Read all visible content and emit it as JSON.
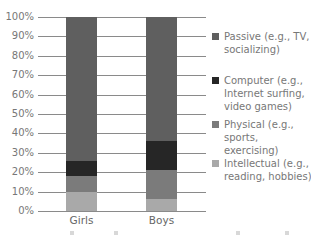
{
  "chart_data": {
    "type": "bar",
    "stacked": true,
    "orientation": "vertical",
    "title": "",
    "xlabel": "",
    "ylabel": "",
    "ylim": [
      0,
      100
    ],
    "y_ticks": [
      "0%",
      "10%",
      "20%",
      "30%",
      "40%",
      "50%",
      "60%",
      "70%",
      "80%",
      "90%",
      "100%"
    ],
    "grid": true,
    "legend_position": "right",
    "categories": [
      "Girls",
      "Boys"
    ],
    "series": [
      {
        "name": "Intellectual (e.g., reading, hobbies)",
        "color": "#a9a9a9",
        "values": [
          10,
          6
        ]
      },
      {
        "name": "Physical (e.g., sports, exercising)",
        "color": "#7b7b7b",
        "values": [
          8,
          15
        ]
      },
      {
        "name": "Computer (e.g., Internet surfing, video games)",
        "color": "#262626",
        "values": [
          8,
          15
        ]
      },
      {
        "name": "Passive (e.g., TV, socializing)",
        "color": "#5f5f5f",
        "values": [
          74,
          64
        ]
      }
    ]
  },
  "legend": [
    {
      "line1": "Passive (e.g., TV,",
      "line2": "socializing)",
      "line3": "",
      "color": "#5f5f5f"
    },
    {
      "line1": "Computer (e.g.,",
      "line2": "Internet surfing,",
      "line3": "video games)",
      "color": "#262626"
    },
    {
      "line1": "Physical (e.g.,",
      "line2": "sports, exercising)",
      "line3": "",
      "color": "#7b7b7b"
    },
    {
      "line1": "Intellectual (e.g.,",
      "line2": "reading, hobbies)",
      "line3": "",
      "color": "#a9a9a9"
    }
  ]
}
